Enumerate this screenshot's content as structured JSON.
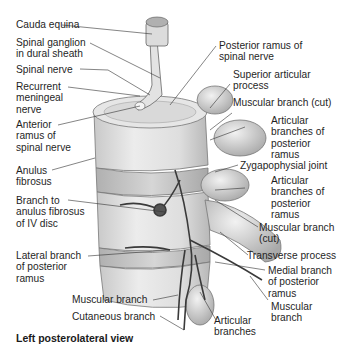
{
  "figure": {
    "caption": "Left posterolateral view",
    "labels_left": [
      {
        "id": "cauda-equina",
        "lines": [
          "Cauda equina"
        ]
      },
      {
        "id": "spinal-ganglion",
        "lines": [
          "Spinal ganglion",
          "in dural sheath"
        ]
      },
      {
        "id": "spinal-nerve",
        "lines": [
          "Spinal nerve"
        ]
      },
      {
        "id": "recurrent-meningeal-nerve",
        "lines": [
          "Recurrent",
          "meningeal",
          "nerve"
        ]
      },
      {
        "id": "anterior-ramus",
        "lines": [
          "Anterior",
          "ramus of",
          "spinal nerve"
        ]
      },
      {
        "id": "anulus-fibrosus",
        "lines": [
          "Anulus",
          "fibrosus"
        ]
      },
      {
        "id": "branch-to-anulus",
        "lines": [
          "Branch to",
          "anulus fibrosus",
          "of IV disc"
        ]
      },
      {
        "id": "lateral-branch",
        "lines": [
          "Lateral branch",
          "of posterior",
          "ramus"
        ]
      },
      {
        "id": "muscular-branch-bottom",
        "lines": [
          "Muscular branch"
        ]
      },
      {
        "id": "cutaneous-branch",
        "lines": [
          "Cutaneous branch"
        ]
      }
    ],
    "labels_right": [
      {
        "id": "posterior-ramus",
        "lines": [
          "Posterior ramus of",
          "spinal nerve"
        ]
      },
      {
        "id": "superior-articular-process",
        "lines": [
          "Superior articular",
          "process"
        ]
      },
      {
        "id": "muscular-branch-cut-top",
        "lines": [
          "Muscular branch (cut)"
        ]
      },
      {
        "id": "articular-branches-1",
        "lines": [
          "Articular",
          "branches of",
          "posterior",
          "ramus"
        ]
      },
      {
        "id": "zygapophysial-joint",
        "lines": [
          "Zygapophysial joint"
        ]
      },
      {
        "id": "articular-branches-2",
        "lines": [
          "Articular",
          "branches of",
          "posterior",
          "ramus"
        ]
      },
      {
        "id": "muscular-branch-cut-2",
        "lines": [
          "Muscular branch",
          "(cut)"
        ]
      },
      {
        "id": "transverse-process",
        "lines": [
          "Transverse process"
        ]
      },
      {
        "id": "medial-branch",
        "lines": [
          "Medial branch",
          "of posterior",
          "ramus"
        ]
      },
      {
        "id": "muscular-branch-right",
        "lines": [
          "Muscular",
          "branch"
        ]
      },
      {
        "id": "articular-branches-bottom",
        "lines": [
          "Articular",
          "branches"
        ]
      }
    ]
  }
}
